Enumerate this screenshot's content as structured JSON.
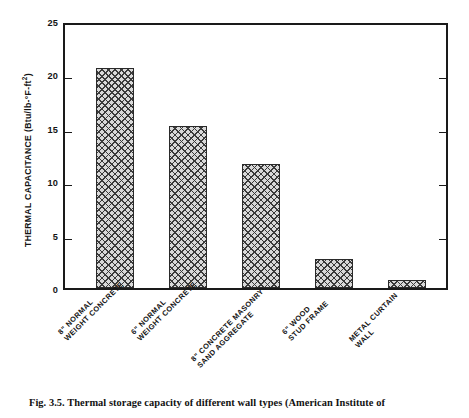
{
  "chart_data": {
    "type": "bar",
    "title": "",
    "xlabel": "",
    "ylabel": "THERMAL CAPACITANCE (Btu/lb-°F-ft²)",
    "ylim": [
      0,
      25
    ],
    "yticks": [
      0,
      5,
      10,
      15,
      20,
      25
    ],
    "grid": false,
    "legend": null,
    "categories": [
      "8\" NORMAL WEIGHT CONCRETE",
      "6\" NORMAL WEIGHT CONCRETE",
      "8\" CONCRETE MASONRY SAND AGGREGATE",
      "6\" WOOD STUD FRAME",
      "METAL CURTAIN WALL"
    ],
    "values": [
      20.9,
      15.4,
      11.8,
      2.75,
      0.8
    ]
  },
  "axis": {
    "y_title_main": "THERMAL CAPACITANCE (Btu/lb-",
    "y_title_deg": "°",
    "y_title_mid": "F-ft",
    "y_title_sup": "2",
    "y_title_end": ")",
    "ticks": [
      {
        "value": "25"
      },
      {
        "value": "20"
      },
      {
        "value": "15"
      },
      {
        "value": "10"
      },
      {
        "value": "5"
      },
      {
        "value": "0"
      }
    ]
  },
  "categories": [
    {
      "line1": "8\" NORMAL",
      "line2": "WEIGHT CONCRETE"
    },
    {
      "line1": "6\" NORMAL",
      "line2": "WEIGHT CONCRETE"
    },
    {
      "line1": "8\" CONCRETE MASONRY",
      "line2": "SAND AGGREGATE"
    },
    {
      "line1": "6\" WOOD",
      "line2": "STUD FRAME"
    },
    {
      "line1": "METAL CURTAIN",
      "line2": "WALL"
    }
  ],
  "caption": {
    "text": "Fig. 3.5. Thermal storage capacity of different wall types (American Institute of"
  },
  "colors": {
    "axis": "#1a1a1a",
    "bar_fill": "#d9d9d9",
    "bar_hatch": "#3a3a3a",
    "text": "#141414",
    "background": "#ffffff"
  }
}
